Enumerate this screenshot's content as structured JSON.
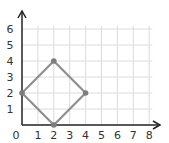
{
  "chart_data": {
    "type": "scatter",
    "title": "",
    "xlabel": "",
    "ylabel": "",
    "xlim": [
      0,
      8
    ],
    "ylim": [
      0,
      6
    ],
    "grid": true,
    "x_ticks": [
      "0",
      "1",
      "2",
      "3",
      "4",
      "5",
      "6",
      "7",
      "8"
    ],
    "y_ticks": [
      "1",
      "2",
      "3",
      "4",
      "5",
      "6"
    ],
    "series": [
      {
        "name": "square",
        "closed": true,
        "points": [
          {
            "x": 0,
            "y": 2
          },
          {
            "x": 2,
            "y": 4
          },
          {
            "x": 4,
            "y": 2
          },
          {
            "x": 2,
            "y": 0
          }
        ]
      }
    ]
  },
  "colors": {
    "grid": "#dcdcdc",
    "axis": "#222222",
    "shape": "#8f8f8f",
    "vertex": "#7d7d7d"
  }
}
